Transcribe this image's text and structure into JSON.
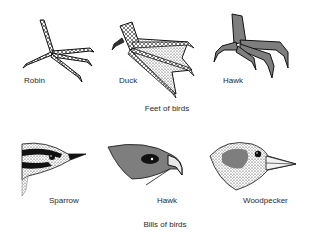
{
  "feet": {
    "caption": "Feet of birds",
    "items": [
      {
        "label": "Robin"
      },
      {
        "label": "Duck"
      },
      {
        "label": "Hawk"
      }
    ]
  },
  "bills": {
    "caption": "Bills of birds",
    "items": [
      {
        "label": "Sparrow"
      },
      {
        "label": "Hawk"
      },
      {
        "label": "Woodpecker"
      }
    ]
  }
}
